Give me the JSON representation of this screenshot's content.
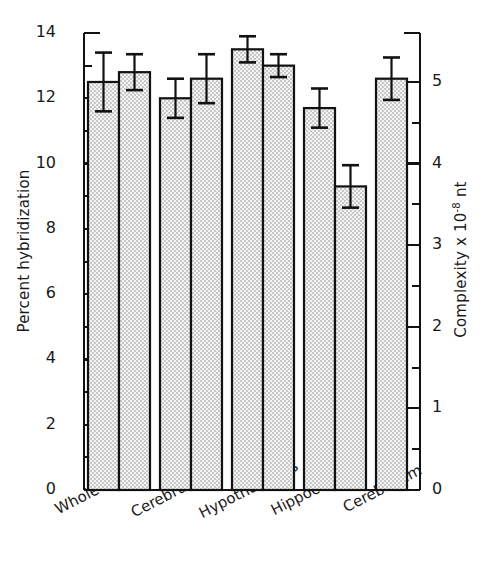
{
  "chart_data": {
    "type": "bar",
    "title": "",
    "subtitle": "",
    "xlabel": "",
    "ylabel": "Percent hybridization",
    "y2label": "Complexity x 10-8 nt",
    "y2label_parts": {
      "prefix": "Complexity x 10",
      "exponent": "-8",
      "suffix": " nt"
    },
    "ylim": [
      0,
      14
    ],
    "y2lim": [
      0,
      5.6
    ],
    "yticks": [
      0,
      2,
      4,
      6,
      8,
      10,
      12,
      14
    ],
    "ytick_labels": [
      "0",
      "2",
      "4",
      "6",
      "8",
      "10",
      "12",
      "14"
    ],
    "yminor_ticks": [
      1,
      3,
      5,
      7,
      9,
      11,
      13
    ],
    "y2ticks": [
      0,
      1,
      2,
      3,
      4,
      5
    ],
    "y2tick_labels": [
      "0",
      "1",
      "2",
      "3",
      "4",
      "5"
    ],
    "y2minor_ticks": [
      0.5,
      1.5,
      2.5,
      3.5,
      4.5
    ],
    "grid": false,
    "legend": "none",
    "categories": [
      "Whole brain",
      "Cerebrum",
      "Hypothalamus",
      "Hippocampus",
      "Cerebellum"
    ],
    "series": [
      {
        "name": "bar-1",
        "values": [
          12.5,
          12.0,
          13.5,
          11.7,
          12.6
        ],
        "errors": [
          0.9,
          0.6,
          0.4,
          0.6,
          0.65
        ]
      },
      {
        "name": "bar-2",
        "values": [
          12.8,
          12.6,
          13.0,
          9.3,
          null
        ],
        "errors": [
          0.55,
          0.75,
          0.35,
          0.65,
          null
        ]
      }
    ],
    "bar_fill_color": "#e8e8e8",
    "bar_edge_color": "#111111",
    "error_bar_color": "#111111",
    "axis_color": "#111111",
    "background_color": "#ffffff"
  },
  "axes": {
    "left_title": "Percent hybridization",
    "right_title_prefix": "Complexity x 10",
    "right_title_exponent": "-8",
    "right_title_suffix": " nt"
  }
}
